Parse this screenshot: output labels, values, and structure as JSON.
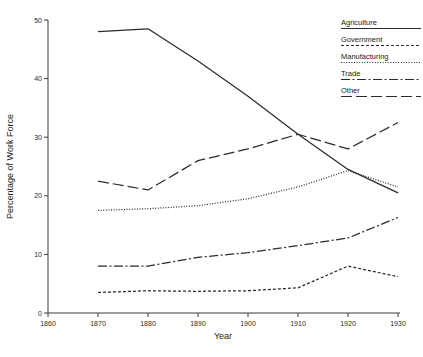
{
  "chart_data": {
    "type": "line",
    "title": "",
    "xlabel": "Year",
    "ylabel": "Percentage of Work Force",
    "x": [
      1870,
      1880,
      1890,
      1900,
      1910,
      1920,
      1930
    ],
    "xlim": [
      1860,
      1930
    ],
    "ylim": [
      0,
      50
    ],
    "xticks": [
      1860,
      1870,
      1880,
      1890,
      1900,
      1910,
      1920,
      1930
    ],
    "xticklabels": [
      "1860",
      "1870",
      "1880",
      "1890",
      "1900",
      "1910",
      "1920",
      "1930"
    ],
    "yticks": [
      0,
      10,
      20,
      30,
      40,
      50
    ],
    "yticklabels": [
      "0",
      "10",
      "20",
      "30",
      "40",
      "50"
    ],
    "grid": false,
    "legend_position": "top-right",
    "series": [
      {
        "name": "Agriculture",
        "style": "solid",
        "dash": "none",
        "color": "#2b2b2b",
        "values": [
          48.0,
          48.5,
          43.0,
          37.0,
          30.5,
          24.5,
          20.5
        ]
      },
      {
        "name": "Government",
        "style": "short-dash",
        "dash": "3,2",
        "color": "#2b2b2b",
        "values": [
          3.5,
          3.8,
          3.7,
          3.8,
          4.3,
          8.0,
          6.2
        ]
      },
      {
        "name": "Manufacturing",
        "style": "dotted",
        "dash": "1,1.6",
        "color": "#2b2b2b",
        "values": [
          17.5,
          17.8,
          18.3,
          19.5,
          21.5,
          24.3,
          21.5
        ]
      },
      {
        "name": "Trade",
        "style": "dash-dot",
        "dash": "9,2.5,2,2.5",
        "color": "#2b2b2b",
        "values": [
          8.0,
          8.0,
          9.5,
          10.3,
          11.5,
          12.8,
          16.3
        ]
      },
      {
        "name": "Other",
        "style": "long-dash",
        "dash": "11,4",
        "color": "#2b2b2b",
        "values": [
          22.5,
          21.0,
          26.0,
          28.0,
          30.5,
          28.0,
          32.5
        ]
      }
    ]
  },
  "legend": {
    "entries": [
      {
        "label": "Agriculture"
      },
      {
        "label": "Government"
      },
      {
        "label": "Manufacturing"
      },
      {
        "label": "Trade"
      },
      {
        "label": "Other"
      }
    ]
  },
  "axes": {
    "x_title": "Year",
    "y_title": "Percentage of Work Force"
  },
  "footer": {
    "clipped_text": ""
  }
}
